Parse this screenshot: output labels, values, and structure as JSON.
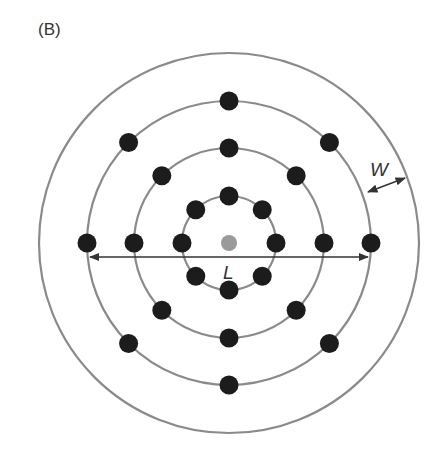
{
  "panel_label": "(B)",
  "labels": {
    "length": "L",
    "width": "W"
  },
  "colors": {
    "ring": "#8a8a8a",
    "dot": "#1c1c1c",
    "center": "#9a9a9a",
    "arrow": "#333333"
  },
  "center": {
    "x": 229,
    "y": 243
  },
  "rings": [
    {
      "r": 47,
      "dots": 8
    },
    {
      "r": 95,
      "dots": 8
    },
    {
      "r": 142,
      "dots": 8
    },
    {
      "r": 190,
      "dots": 0
    }
  ]
}
